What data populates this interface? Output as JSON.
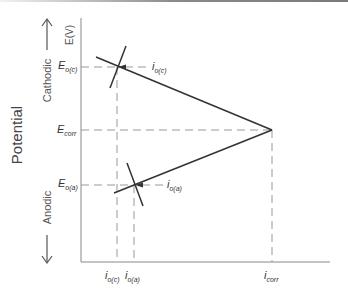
{
  "diagram": {
    "type": "evans_diagram",
    "y_axis_unit": "E(V)",
    "y_axis_title": "Potential",
    "direction_labels": {
      "up": "Cathodic",
      "down": "Anodic"
    },
    "potential_labels": [
      {
        "id": "Eoc",
        "symbol": "E",
        "subscript": "o(c)"
      },
      {
        "id": "Ecorr",
        "symbol": "E",
        "subscript": "corr"
      },
      {
        "id": "Eoa",
        "symbol": "E",
        "subscript": "o(a)"
      }
    ],
    "current_labels": [
      {
        "id": "ioc",
        "symbol": "i",
        "subscript": "o(c)"
      },
      {
        "id": "ioa",
        "symbol": "i",
        "subscript": "o(a)"
      },
      {
        "id": "icorr",
        "symbol": "i",
        "subscript": "corr"
      }
    ],
    "pointer_labels": [
      {
        "id": "ioc_pointer",
        "symbol": "i",
        "subscript": "o(c)"
      },
      {
        "id": "ioa_pointer",
        "symbol": "i",
        "subscript": "o(a)"
      }
    ],
    "colors": {
      "line": "#333333",
      "dashed": "#999999",
      "axis": "#888888",
      "text": "#333333"
    }
  }
}
